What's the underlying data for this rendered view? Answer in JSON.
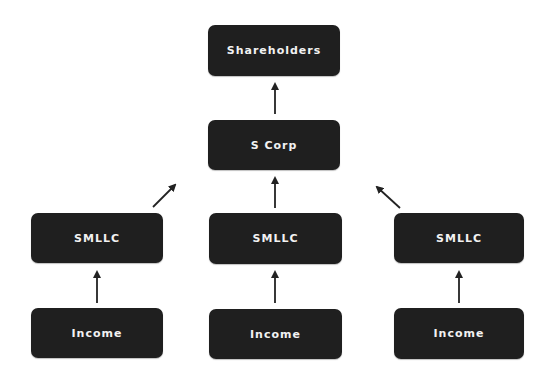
{
  "diagram": {
    "nodes": {
      "shareholders": {
        "label": "Shareholders"
      },
      "scorp": {
        "label": "S Corp"
      },
      "smllc_left": {
        "label": "SMLLC"
      },
      "smllc_middle": {
        "label": "SMLLC"
      },
      "smllc_right": {
        "label": "SMLLC"
      },
      "income_left": {
        "label": "Income"
      },
      "income_middle": {
        "label": "Income"
      },
      "income_right": {
        "label": "Income"
      }
    },
    "edges": [
      {
        "from": "scorp",
        "to": "shareholders"
      },
      {
        "from": "smllc_left",
        "to": "scorp"
      },
      {
        "from": "smllc_middle",
        "to": "scorp"
      },
      {
        "from": "smllc_right",
        "to": "scorp"
      },
      {
        "from": "income_left",
        "to": "smllc_left"
      },
      {
        "from": "income_middle",
        "to": "smllc_middle"
      },
      {
        "from": "income_right",
        "to": "smllc_right"
      }
    ],
    "colors": {
      "node_fill": "#1f1f1f",
      "node_text": "#f2f2f2",
      "arrow": "#222222",
      "background": "#ffffff"
    }
  }
}
